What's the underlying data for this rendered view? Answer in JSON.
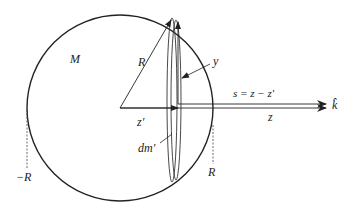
{
  "diagram": {
    "labels": {
      "mass": "M",
      "radius": "R",
      "y_axis": "y",
      "separation": "s = z − z′",
      "unit_vector": "k̂",
      "z_field": "z",
      "z_prime": "z′",
      "mass_element": "dm′",
      "neg_R": "−R",
      "pos_R": "R"
    },
    "colors": {
      "stroke": "#222222",
      "background": "#ffffff"
    }
  }
}
